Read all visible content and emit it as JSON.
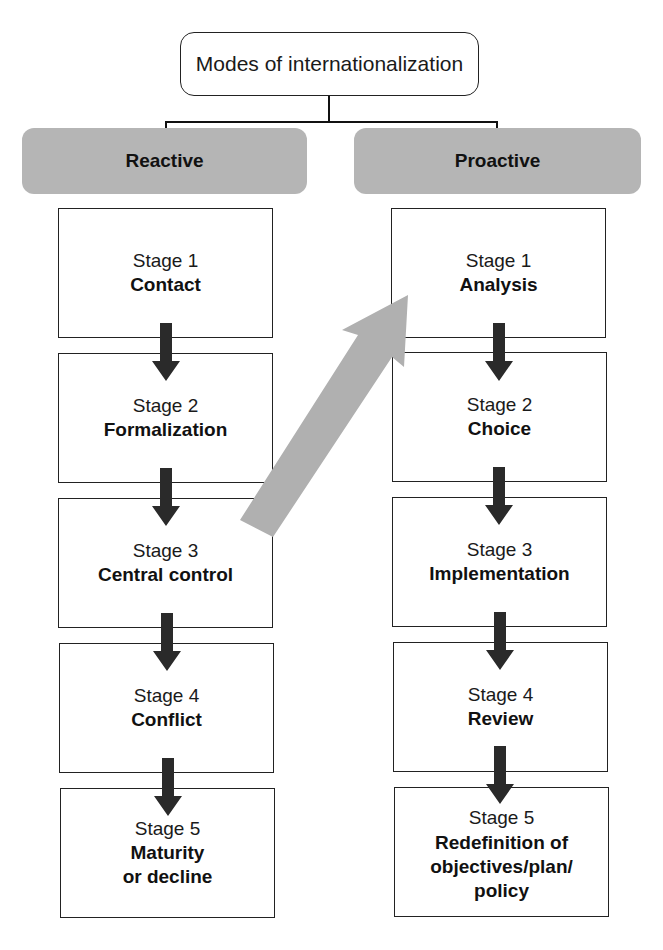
{
  "title": "Modes of internationalization",
  "colors": {
    "mode_fill": "#b5b5b5",
    "arrow_dark": "#2a2a2a",
    "transition_arrow": "#b0b0b0",
    "border": "#222222"
  },
  "columns": [
    {
      "mode": "Reactive",
      "stages": [
        {
          "number": "Stage 1",
          "name": "Contact"
        },
        {
          "number": "Stage 2",
          "name": "Formalization"
        },
        {
          "number": "Stage 3",
          "name": "Central control"
        },
        {
          "number": "Stage 4",
          "name": "Conflict"
        },
        {
          "number": "Stage 5",
          "name": "Maturity or decline",
          "lines": [
            "Maturity",
            "or decline"
          ]
        }
      ]
    },
    {
      "mode": "Proactive",
      "stages": [
        {
          "number": "Stage 1",
          "name": "Analysis"
        },
        {
          "number": "Stage 2",
          "name": "Choice"
        },
        {
          "number": "Stage 3",
          "name": "Implementation"
        },
        {
          "number": "Stage 4",
          "name": "Review"
        },
        {
          "number": "Stage 5",
          "name": "Redefinition of objectives/plan/policy",
          "lines": [
            "Redefinition of",
            "objectives/plan/",
            "policy"
          ]
        }
      ]
    }
  ],
  "transition": {
    "from": "Reactive Stage 3 Central control",
    "to": "Proactive Stage 1 Analysis"
  }
}
